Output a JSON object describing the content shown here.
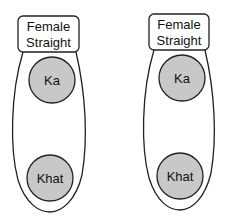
{
  "diagram": {
    "groups": [
      {
        "header_line1": "Female",
        "header_line2": "Straight",
        "top_node": "Ka",
        "bottom_node": "Khat"
      },
      {
        "header_line1": "Female",
        "header_line2": "Straight",
        "top_node": "Ka",
        "bottom_node": "Khat"
      }
    ],
    "colors": {
      "node_fill": "#c8c8c8",
      "stroke": "#222222",
      "background": "#ffffff"
    }
  }
}
